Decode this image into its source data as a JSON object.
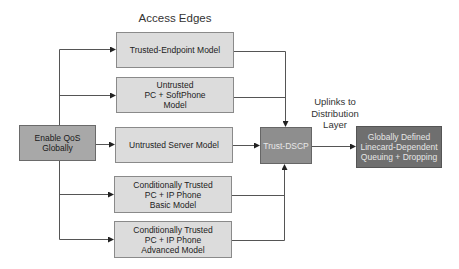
{
  "title": "Access Edges",
  "source_node": {
    "label": "Enable QoS Globally"
  },
  "access_models": [
    {
      "label": "Trusted-Endpoint Model"
    },
    {
      "label": "Untrusted\nPC + SoftPhone\nModel"
    },
    {
      "label": "Untrusted Server Model"
    },
    {
      "label": "Conditionally Trusted\nPC + IP Phone\nBasic Model"
    },
    {
      "label": "Conditionally Trusted\nPC + IP Phone\nAdvanced Model"
    }
  ],
  "trust_node": {
    "label": "Trust-DSCP"
  },
  "uplink_label": "Uplinks to\nDistribution\nLayer",
  "queuing_node": {
    "label": "Globally Defined\nLinecard-Dependent\nQueuing + Dropping"
  },
  "colors": {
    "light_box": "#dcdcdc",
    "source_box": "#a8a8a8",
    "trust_box": "#8e8e8e",
    "queuing_box": "#6f6f6f",
    "line": "#555555"
  }
}
